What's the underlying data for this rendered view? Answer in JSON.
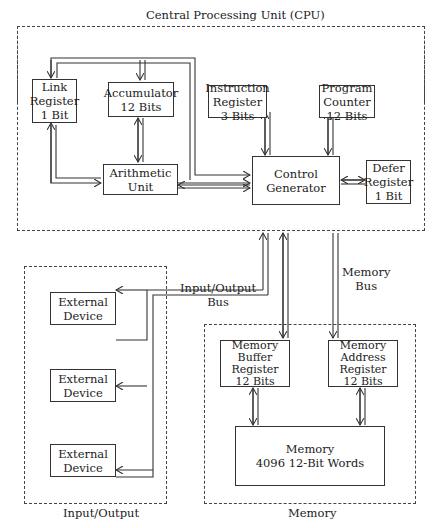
{
  "title": "Central Processing Unit (CPU)",
  "sections": {
    "cpu": "Central Processing Unit (CPU)",
    "io": "Input/Output",
    "memory": "Memory"
  },
  "blocks": {
    "link_register": [
      "Link",
      "Register",
      "1 Bit"
    ],
    "accumulator": [
      "Accumulator",
      "12 Bits"
    ],
    "instruction_register": [
      "Instruction",
      "Register",
      "3 Bits"
    ],
    "program_counter": [
      "Program",
      "Counter",
      "12 Bits"
    ],
    "arithmetic_unit": [
      "Arithmetic",
      "Unit"
    ],
    "control_generator": [
      "Control",
      "Generator"
    ],
    "defer_register": [
      "Defer",
      "Register",
      "1 Bit"
    ],
    "external_devices": [
      [
        "External",
        "Device"
      ],
      [
        "External",
        "Device"
      ],
      [
        "External",
        "Device"
      ]
    ],
    "memory_buffer_register": [
      "Memory",
      "Buffer",
      "Register",
      "12 Bits"
    ],
    "memory_address_register": [
      "Memory",
      "Address",
      "Register",
      "12 Bits"
    ],
    "memory": [
      "Memory",
      "4096 12-Bit Words"
    ]
  },
  "buses": {
    "io_bus": [
      "Input/Output",
      "Bus"
    ],
    "memory_bus": [
      "Memory",
      "Bus"
    ]
  }
}
